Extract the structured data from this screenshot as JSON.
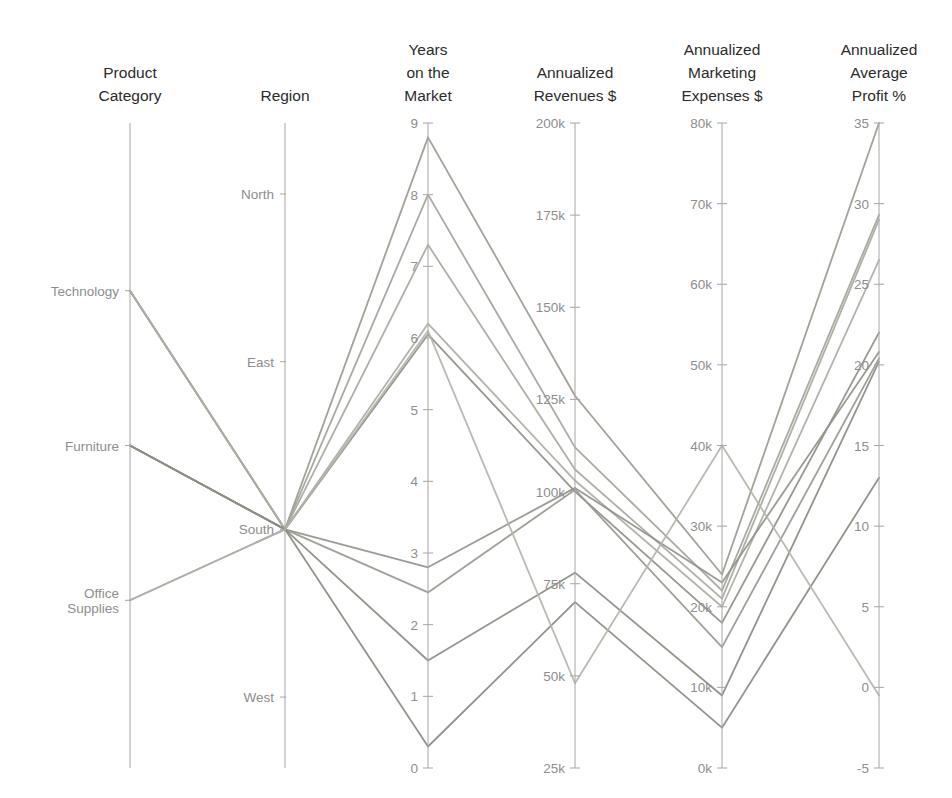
{
  "chart_data": {
    "type": "line",
    "subtype": "parallel-coordinates",
    "title": "",
    "grid": false,
    "legend": "none",
    "axes": [
      {
        "key": "product_category",
        "label": "Product Category",
        "label_lines": [
          "Product",
          "Category"
        ],
        "scale": "categorical",
        "categories": [
          "Technology",
          "Furniture",
          "Office Supplies"
        ],
        "category_label_lines": [
          [
            "Technology"
          ],
          [
            "Furniture"
          ],
          [
            "Office",
            "Supplies"
          ]
        ]
      },
      {
        "key": "region",
        "label": "Region",
        "label_lines": [
          "Region"
        ],
        "scale": "categorical",
        "categories": [
          "North",
          "East",
          "South",
          "West"
        ],
        "category_label_lines": [
          [
            "North"
          ],
          [
            "East"
          ],
          [
            "South"
          ],
          [
            "West"
          ]
        ]
      },
      {
        "key": "years_on_market",
        "label": "Years on the Market",
        "label_lines": [
          "Years",
          "on the",
          "Market"
        ],
        "scale": "linear",
        "range": [
          0,
          9
        ],
        "ticks": [
          0,
          1,
          2,
          3,
          4,
          5,
          6,
          7,
          8,
          9
        ],
        "tick_labels": [
          "0",
          "1",
          "2",
          "3",
          "4",
          "5",
          "6",
          "7",
          "8",
          "9"
        ]
      },
      {
        "key": "annualized_revenues",
        "label": "Annualized Revenues $",
        "label_lines": [
          "Annualized",
          "Revenues $"
        ],
        "scale": "linear",
        "range": [
          25000,
          200000
        ],
        "ticks": [
          25000,
          50000,
          75000,
          100000,
          125000,
          150000,
          175000,
          200000
        ],
        "tick_labels": [
          "25k",
          "50k",
          "75k",
          "100k",
          "125k",
          "150k",
          "175k",
          "200k"
        ]
      },
      {
        "key": "annualized_marketing_expenses",
        "label": "Annualized Marketing Expenses $",
        "label_lines": [
          "Annualized",
          "Marketing",
          "Expenses $"
        ],
        "scale": "linear",
        "range": [
          0,
          80000
        ],
        "ticks": [
          0,
          10000,
          20000,
          30000,
          40000,
          50000,
          60000,
          70000,
          80000
        ],
        "tick_labels": [
          "0k",
          "10k",
          "20k",
          "30k",
          "40k",
          "50k",
          "60k",
          "70k",
          "80k"
        ]
      },
      {
        "key": "annualized_average_profit",
        "label": "Annualized Average Profit %",
        "label_lines": [
          "Annualized",
          "Average",
          "Profit %"
        ],
        "scale": "linear",
        "range": [
          -5,
          35
        ],
        "ticks": [
          -5,
          0,
          5,
          10,
          15,
          20,
          25,
          30,
          35
        ],
        "tick_labels": [
          "-5",
          "0",
          "5",
          "10",
          "15",
          "20",
          "25",
          "30",
          "35"
        ]
      }
    ],
    "series": [
      {
        "name": "line-1",
        "color": "#9a9a8f",
        "values": {
          "product_category": "Technology",
          "region": "South",
          "years_on_market": 8.8,
          "annualized_revenues": 126000,
          "annualized_marketing_expenses": 24000,
          "annualized_average_profit": 35.0
        }
      },
      {
        "name": "line-2",
        "color": "#a3a39a",
        "values": {
          "product_category": "Technology",
          "region": "South",
          "years_on_market": 8.0,
          "annualized_revenues": 112000,
          "annualized_marketing_expenses": 22000,
          "annualized_average_profit": 29.3
        }
      },
      {
        "name": "line-3",
        "color": "#a8a89e",
        "values": {
          "product_category": "Technology",
          "region": "South",
          "years_on_market": 7.3,
          "annualized_revenues": 106000,
          "annualized_marketing_expenses": 21000,
          "annualized_average_profit": 29.0
        }
      },
      {
        "name": "line-4",
        "color": "#adada4",
        "values": {
          "product_category": "Technology",
          "region": "South",
          "years_on_market": 6.2,
          "annualized_revenues": 103000,
          "annualized_marketing_expenses": 20000,
          "annualized_average_profit": 26.5
        }
      },
      {
        "name": "line-5",
        "color": "#8f8f86",
        "values": {
          "product_category": "Furniture",
          "region": "South",
          "years_on_market": 6.05,
          "annualized_revenues": 100000,
          "annualized_marketing_expenses": 18000,
          "annualized_average_profit": 22.0
        }
      },
      {
        "name": "line-6",
        "color": "#93938a",
        "values": {
          "product_category": "Furniture",
          "region": "South",
          "years_on_market": 2.8,
          "annualized_revenues": 101000,
          "annualized_marketing_expenses": 23000,
          "annualized_average_profit": 20.8
        }
      },
      {
        "name": "line-7",
        "color": "#98988f",
        "values": {
          "product_category": "Furniture",
          "region": "South",
          "years_on_market": 2.45,
          "annualized_revenues": 100500,
          "annualized_marketing_expenses": 15000,
          "annualized_average_profit": 20.4
        }
      },
      {
        "name": "line-8",
        "color": "#8b8b82",
        "values": {
          "product_category": "Furniture",
          "region": "South",
          "years_on_market": 1.5,
          "annualized_revenues": 78000,
          "annualized_marketing_expenses": 9000,
          "annualized_average_profit": 20.2
        }
      },
      {
        "name": "line-9",
        "color": "#8a8a81",
        "values": {
          "product_category": "Office Supplies",
          "region": "South",
          "years_on_market": 0.3,
          "annualized_revenues": 70000,
          "annualized_marketing_expenses": 5000,
          "annualized_average_profit": 13.0
        }
      },
      {
        "name": "line-10",
        "color": "#b4b4ab",
        "values": {
          "product_category": "Office Supplies",
          "region": "South",
          "years_on_market": 6.1,
          "annualized_revenues": 48000,
          "annualized_marketing_expenses": 40000,
          "annualized_average_profit": -0.5
        }
      }
    ]
  },
  "layout": {
    "axis_x": [
      130,
      285,
      428,
      575,
      722,
      879
    ],
    "plot_top": 123,
    "plot_bottom": 768,
    "title_baselines": [
      [
        76,
        96
      ],
      [
        96
      ],
      [
        50,
        72,
        96
      ],
      [
        76,
        96
      ],
      [
        50,
        72,
        96
      ],
      [
        50,
        72,
        96
      ]
    ],
    "colors": {
      "axis": "#a9a9a9",
      "tick_text": "#8e8e8e",
      "title_text": "#2b2b2b",
      "background": "#ffffff"
    }
  }
}
